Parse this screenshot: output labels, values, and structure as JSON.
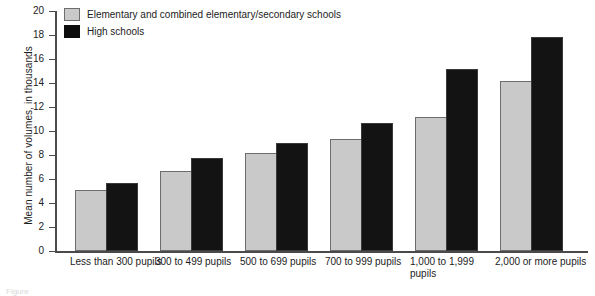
{
  "chart_data": {
    "type": "bar",
    "title": "",
    "xlabel": "",
    "ylabel": "Mean number of volumes, in thousands",
    "ylim": [
      0,
      20
    ],
    "ytick_step": 2,
    "yticks": [
      "20",
      "18",
      "16",
      "14",
      "12",
      "10",
      "8",
      "6",
      "4",
      "2",
      "0"
    ],
    "grid": false,
    "legend_position": "top-left",
    "categories": [
      "Less than 300 pupils",
      "300 to 499 pupils",
      "500 to 699 pupils",
      "700 to 999 pupils",
      "1,000 to 1,999 pupils",
      "2,000 or more pupils"
    ],
    "series": [
      {
        "name": "Elementary and combined elementary/secondary schools",
        "color": "#c9c9c9",
        "values": [
          4.9,
          6.5,
          8.0,
          9.2,
          11.0,
          14.0
        ]
      },
      {
        "name": "High schools",
        "color": "#0d0d0d",
        "values": [
          5.5,
          7.6,
          8.8,
          10.5,
          15.0,
          17.7
        ]
      }
    ]
  },
  "legend": {
    "items": [
      {
        "label": "Elementary and combined elementary/secondary schools",
        "swatch": "light"
      },
      {
        "label": "High schools",
        "swatch": "dark"
      }
    ]
  },
  "caption": {
    "text": "Figure"
  }
}
